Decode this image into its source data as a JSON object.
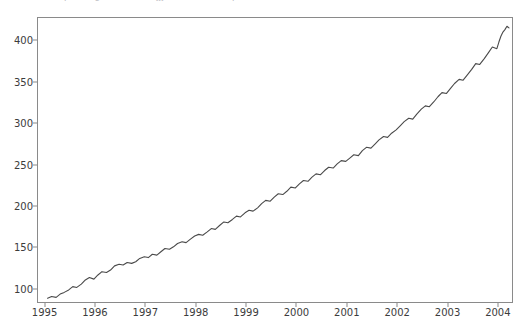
{
  "caption": {
    "text": "plotting the series (jjj) rendered output"
  },
  "figure": {
    "background_color": "#ffffff",
    "spine_color": "#8a8a8a",
    "tick_label_color": "#3c3c3c"
  },
  "chart_data": {
    "type": "line",
    "title": "",
    "xlabel": "",
    "ylabel": "",
    "grid": false,
    "legend": null,
    "line_color": "#4a4a4a",
    "line_width": 1.1,
    "xlim": [
      1994.85,
      2004.3
    ],
    "ylim": [
      83,
      428
    ],
    "xticks": [
      1995,
      1996,
      1997,
      1998,
      1999,
      2000,
      2001,
      2002,
      2003,
      2004
    ],
    "xticklabels": [
      "1995",
      "1996",
      "1997",
      "1998",
      "1999",
      "2000",
      "2001",
      "2002",
      "2003",
      "2004"
    ],
    "yticks": [
      100,
      150,
      200,
      250,
      300,
      350,
      400
    ],
    "yticklabels": [
      "100",
      "150",
      "200",
      "250",
      "300",
      "350",
      "400"
    ],
    "series": [
      {
        "name": "series",
        "x": [
          1995.04,
          1995.12,
          1995.21,
          1995.29,
          1995.37,
          1995.46,
          1995.54,
          1995.62,
          1995.71,
          1995.79,
          1995.87,
          1995.96,
          1996.04,
          1996.12,
          1996.21,
          1996.29,
          1996.37,
          1996.46,
          1996.54,
          1996.62,
          1996.71,
          1996.79,
          1996.87,
          1996.96,
          1997.04,
          1997.12,
          1997.21,
          1997.29,
          1997.37,
          1997.46,
          1997.54,
          1997.62,
          1997.71,
          1997.79,
          1997.87,
          1997.96,
          1998.04,
          1998.12,
          1998.21,
          1998.29,
          1998.37,
          1998.46,
          1998.54,
          1998.62,
          1998.71,
          1998.79,
          1998.87,
          1998.96,
          1999.04,
          1999.12,
          1999.21,
          1999.29,
          1999.37,
          1999.46,
          1999.54,
          1999.62,
          1999.71,
          1999.79,
          1999.87,
          1999.96,
          2000.04,
          2000.12,
          2000.21,
          2000.29,
          2000.37,
          2000.46,
          2000.54,
          2000.62,
          2000.71,
          2000.79,
          2000.87,
          2000.96,
          2001.04,
          2001.12,
          2001.21,
          2001.29,
          2001.37,
          2001.46,
          2001.54,
          2001.62,
          2001.71,
          2001.79,
          2001.87,
          2001.96,
          2002.04,
          2002.12,
          2002.21,
          2002.29,
          2002.37,
          2002.46,
          2002.54,
          2002.62,
          2002.71,
          2002.79,
          2002.87,
          2002.96,
          2003.04,
          2003.12,
          2003.21,
          2003.29,
          2003.37,
          2003.46,
          2003.54,
          2003.62,
          2003.71,
          2003.79,
          2003.87,
          2003.96
        ],
        "values": [
          90,
          92,
          91,
          95,
          97,
          100,
          104,
          103,
          107,
          112,
          115,
          113,
          118,
          122,
          121,
          124,
          129,
          131,
          130,
          133,
          132,
          134,
          138,
          140,
          139,
          143,
          142,
          146,
          150,
          149,
          152,
          156,
          158,
          157,
          161,
          165,
          167,
          166,
          170,
          174,
          173,
          178,
          182,
          181,
          185,
          189,
          188,
          193,
          196,
          195,
          199,
          204,
          208,
          207,
          212,
          216,
          215,
          219,
          224,
          223,
          228,
          232,
          231,
          236,
          240,
          239,
          244,
          248,
          247,
          252,
          256,
          255,
          259,
          263,
          262,
          268,
          272,
          271,
          276,
          281,
          285,
          284,
          289,
          293,
          298,
          303,
          307,
          306,
          312,
          318,
          322,
          321,
          327,
          333,
          338,
          337,
          343,
          349,
          354,
          353,
          359,
          366,
          373,
          372,
          379,
          386,
          393,
          391
        ]
      }
    ],
    "series_extension": {
      "x": [
        2003.96,
        2004.0,
        2004.04,
        2004.08,
        2004.12,
        2004.16,
        2004.2
      ],
      "values": [
        391,
        399,
        406,
        411,
        414,
        418,
        416
      ]
    },
    "summary": {
      "start_value": 90,
      "end_value": 416,
      "min_value": 90,
      "max_value": 419,
      "trend": "increasing",
      "seasonality": "annual oscillation superimposed on upward trend"
    }
  }
}
